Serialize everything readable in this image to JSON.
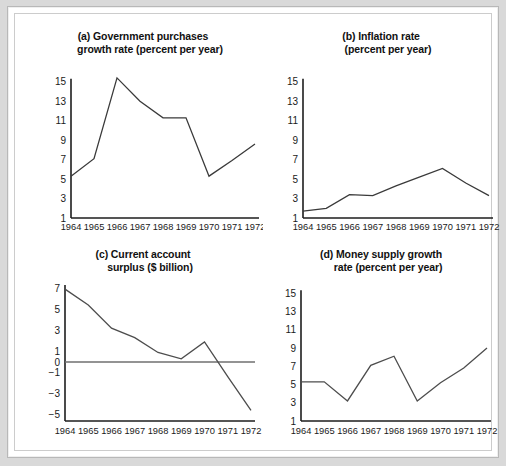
{
  "figure": {
    "background_color": "#d9d9d9",
    "panel_background": "#ffffff",
    "line_color": "#4d4d4d",
    "axis_color": "#1d1d1d"
  },
  "panels": {
    "a": {
      "title_line1": "(a) Government purchases",
      "title_line2": "growth rate (percent per year)"
    },
    "b": {
      "title_line1": "(b) Inflation rate",
      "title_line2": "(percent per year)"
    },
    "c": {
      "title_line1": "(c) Current account",
      "title_line2": "surplus ($ billion)"
    },
    "d": {
      "title_line1": "(d) Money supply growth",
      "title_line2": "rate (percent per year)"
    }
  },
  "chart_data": [
    {
      "id": "a",
      "type": "line",
      "title": "(a) Government purchases growth rate (percent per year)",
      "xlabel": "",
      "ylabel": "percent per year",
      "x": [
        1964,
        1965,
        1966,
        1967,
        1968,
        1969,
        1970,
        1971,
        1972
      ],
      "xtick_labels": [
        "1964",
        "1965",
        "1966",
        "1967",
        "1968",
        "1969",
        "1970",
        "1971",
        "1972"
      ],
      "ytick_labels": [
        "15",
        "13",
        "11",
        "9",
        "7",
        "5",
        "3",
        "1"
      ],
      "yticks": [
        15,
        13,
        11,
        9,
        7,
        5,
        3,
        1
      ],
      "ylim": [
        1,
        15.8
      ],
      "values": [
        5.3,
        7.1,
        15.4,
        13.0,
        11.3,
        11.3,
        5.3,
        6.9,
        8.6
      ],
      "grid": false,
      "legend": "none"
    },
    {
      "id": "b",
      "type": "line",
      "title": "(b) Inflation rate (percent per year)",
      "xlabel": "",
      "ylabel": "percent per year",
      "x": [
        1964,
        1965,
        1966,
        1967,
        1968,
        1969,
        1970,
        1971,
        1972
      ],
      "xtick_labels": [
        "1964",
        "1965",
        "1966",
        "1967",
        "1968",
        "1969",
        "1970",
        "1971",
        "1972"
      ],
      "ytick_labels": [
        "15",
        "13",
        "11",
        "9",
        "7",
        "5",
        "3",
        "1"
      ],
      "yticks": [
        15,
        13,
        11,
        9,
        7,
        5,
        3,
        1
      ],
      "ylim": [
        1,
        15.8
      ],
      "values": [
        1.7,
        2.0,
        3.4,
        3.3,
        4.3,
        5.2,
        6.1,
        4.6,
        3.3
      ],
      "grid": false,
      "legend": "none"
    },
    {
      "id": "c",
      "type": "line",
      "title": "(c) Current account surplus ($ billion)",
      "xlabel": "",
      "ylabel": "$ billion",
      "x": [
        1964,
        1965,
        1966,
        1967,
        1968,
        1969,
        1970,
        1971,
        1972
      ],
      "xtick_labels": [
        "1964",
        "1965",
        "1966",
        "1967",
        "1968",
        "1969",
        "1970",
        "1971",
        "1972"
      ],
      "ytick_labels": [
        "7",
        "5",
        "3",
        "1",
        "0",
        "−1",
        "−3",
        "−5"
      ],
      "yticks": [
        7,
        5,
        3,
        1,
        0,
        -1,
        -3,
        -5
      ],
      "ylim": [
        -5.6,
        7.2
      ],
      "values": [
        6.9,
        5.4,
        3.2,
        2.3,
        0.9,
        0.3,
        1.9,
        -1.4,
        -4.6
      ],
      "zero_line": 0,
      "grid": false,
      "legend": "none"
    },
    {
      "id": "d",
      "type": "line",
      "title": "(d) Money supply growth rate (percent per year)",
      "xlabel": "",
      "ylabel": "percent per year",
      "x": [
        1964,
        1965,
        1966,
        1967,
        1968,
        1969,
        1970,
        1971,
        1972
      ],
      "xtick_labels": [
        "1964",
        "1965",
        "1966",
        "1967",
        "1968",
        "1969",
        "1970",
        "1971",
        "1972"
      ],
      "ytick_labels": [
        "15",
        "13",
        "11",
        "9",
        "7",
        "5",
        "3",
        "1"
      ],
      "yticks": [
        15,
        13,
        11,
        9,
        7,
        5,
        3,
        1
      ],
      "ylim": [
        1,
        15.8
      ],
      "values": [
        5.3,
        5.3,
        3.2,
        7.1,
        8.1,
        3.2,
        5.2,
        6.8,
        9.0
      ],
      "grid": false,
      "legend": "none"
    }
  ]
}
